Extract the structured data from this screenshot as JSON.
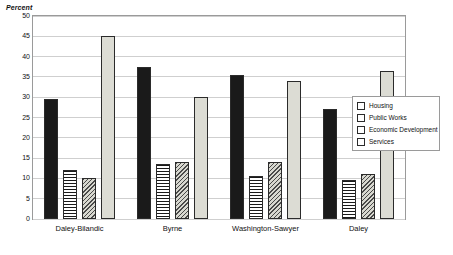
{
  "chart_data": {
    "type": "bar",
    "title": "",
    "subtitle": "",
    "ylabel": "Percent",
    "xlabel": "",
    "ylim": [
      0,
      50
    ],
    "ytick_step": 5,
    "yticks": [
      "0",
      "5",
      "10",
      "15",
      "20",
      "25",
      "30",
      "35",
      "40",
      "45",
      "50"
    ],
    "grid": true,
    "legend_position": "right",
    "categories": [
      "Daley-Bilandic",
      "Byrne",
      "Washington-Sawyer",
      "Daley"
    ],
    "series": [
      {
        "name": "Housing",
        "color": "#1a1a1a",
        "pattern": "solid",
        "values": [
          29.5,
          37.5,
          35.5,
          27.0
        ]
      },
      {
        "name": "Public Works",
        "color": "#1a1a1a",
        "pattern": "horizontal-lines",
        "values": [
          12.0,
          13.5,
          10.5,
          9.5
        ]
      },
      {
        "name": "Economic Development",
        "color": "#4a4a4a",
        "pattern": "diagonal-lines",
        "values": [
          10.0,
          14.0,
          14.0,
          11.0
        ]
      },
      {
        "name": "Services",
        "color": "#dcdcd4",
        "pattern": "solid-light",
        "values": [
          45.0,
          30.0,
          34.0,
          36.5
        ]
      }
    ]
  }
}
